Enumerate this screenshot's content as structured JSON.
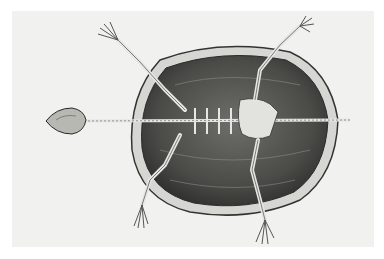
{
  "image": {
    "subject": "Engraving of a turtle skeleton, ventral view, inside its shell",
    "colors": {
      "background": "#ffffff",
      "paper": "#f1f1ef",
      "shell_dark": "#3a3a38",
      "shell_mid": "#6b6b68",
      "rim": "#cfcfcb",
      "bone": "#e2e2de",
      "ink": "#2a2a28"
    }
  }
}
